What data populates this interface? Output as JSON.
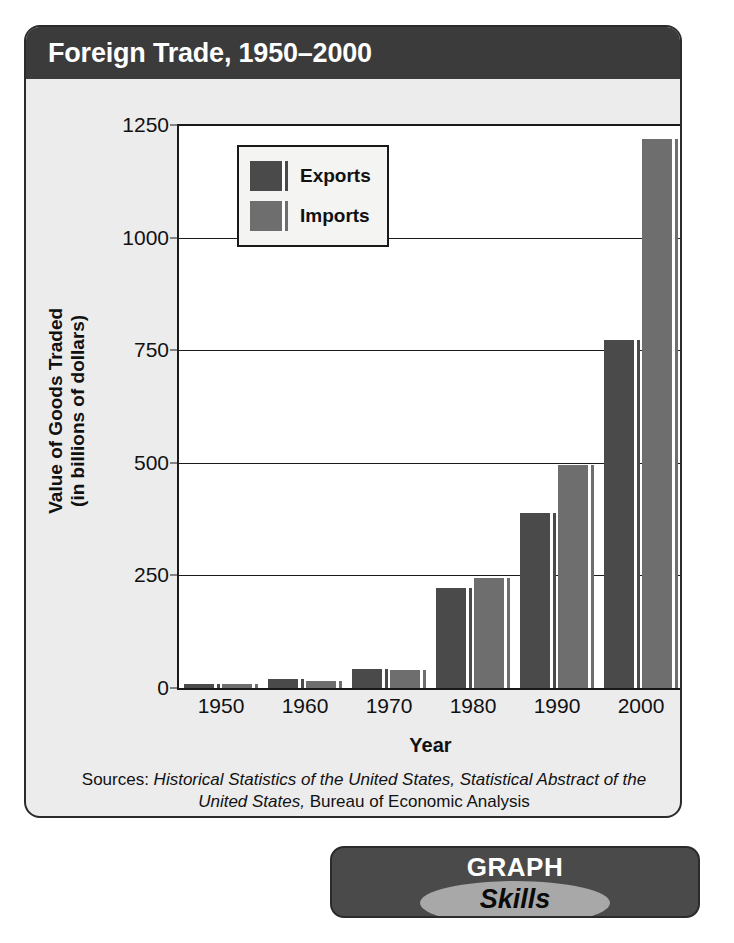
{
  "header": {
    "title": "Foreign Trade, 1950–2000"
  },
  "badge": {
    "line1": "GRAPH",
    "line2": "Skills"
  },
  "sources": {
    "prefix": "Sources: ",
    "italic_1": "Historical Statistics of the United States, Statistical Abstract of the United States,",
    "suffix": " Bureau of Economic Analysis"
  },
  "colors": {
    "exports": "#4a4a4a",
    "imports": "#6e6e6e",
    "header_bar": "#3b3b3b",
    "card_bg": "#ececed",
    "plot_bg": "#ffffff",
    "axis": "#1a1a1a",
    "badge_ellipse": "#a8a8a8"
  },
  "chart_data": {
    "type": "bar",
    "title": "Foreign Trade, 1950–2000",
    "xlabel": "Year",
    "ylabel": "Value of Goods Traded\n(in billions of dollars)",
    "ylabel_line1": "Value of  Goods Traded",
    "ylabel_line2": "(in billions of dollars)",
    "categories": [
      "1950",
      "1960",
      "1970",
      "1980",
      "1990",
      "2000"
    ],
    "series": [
      {
        "name": "Exports",
        "values": [
          10,
          20,
          43,
          221,
          389,
          772
        ]
      },
      {
        "name": "Imports",
        "values": [
          9,
          15,
          40,
          245,
          495,
          1218
        ]
      }
    ],
    "ylim": [
      0,
      1250
    ],
    "yticks": [
      0,
      250,
      500,
      750,
      1000,
      1250
    ],
    "ytick_labels": [
      "0",
      "250",
      "500",
      "750",
      "1000",
      "1250"
    ],
    "grid": true,
    "legend_position": "top-left",
    "legend_entries": [
      "Exports",
      "Imports"
    ]
  }
}
